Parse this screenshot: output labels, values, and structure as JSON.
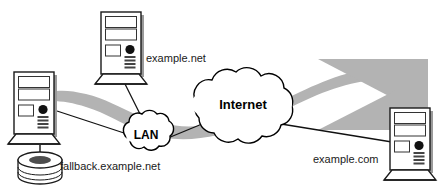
{
  "diagram": {
    "colors": {
      "ribbon_fill": "#b3b3b3",
      "ribbon_fill_light": "#c9c9c9",
      "device_stroke": "#1a1a1a",
      "device_fill": "#ffffff",
      "device_shadow": "#9a9a9a",
      "cloud_fill": "#ffffff",
      "cloud_stroke": "#000000",
      "banner_fill": "#ffffff",
      "text_color": "#1a1a1a",
      "background": "#ffffff",
      "power_button": "#111111"
    },
    "clouds": [
      {
        "id": "lan",
        "label": "LAN",
        "cx": 146,
        "cy": 133,
        "rx": 26,
        "ry": 20
      },
      {
        "id": "internet",
        "label": "Internet",
        "cx": 243,
        "cy": 104,
        "rx": 53,
        "ry": 36
      }
    ],
    "nodes": [
      {
        "id": "fallback-server",
        "label": "fallback.example.net",
        "label_x": 60,
        "label_y": 170,
        "kind": "tower-with-database",
        "x": 14,
        "y": 72
      },
      {
        "id": "example-net-host",
        "label": "example.net",
        "label_x": 146,
        "label_y": 62,
        "kind": "tower",
        "x": 101,
        "y": 12
      },
      {
        "id": "example-com-host",
        "label": "example.com",
        "label_x": 313,
        "label_y": 163,
        "kind": "tower",
        "x": 390,
        "y": 108
      }
    ],
    "links": [
      {
        "from": "example-net-host",
        "to": "lan"
      },
      {
        "from": "fallback-server",
        "to": "lan"
      },
      {
        "from": "lan",
        "to": "internet"
      },
      {
        "from": "internet",
        "to": "example-com-host"
      }
    ],
    "flow": {
      "description": "Wide grey arrow flowing from example.com on the right, through the Internet cloud and the LAN cloud, to the fallback server on the left",
      "direction": "right-to-left",
      "arrowhead_count": 2
    }
  }
}
